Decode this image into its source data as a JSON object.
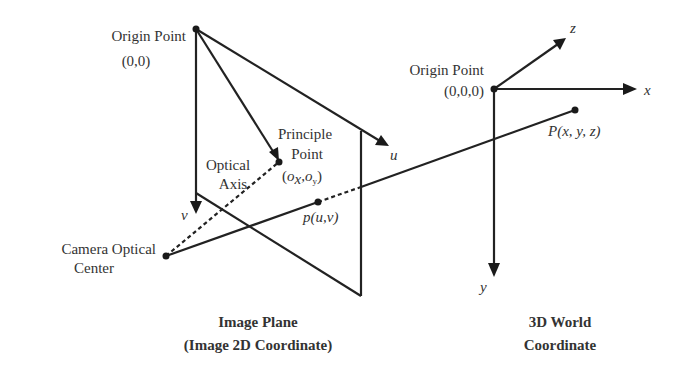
{
  "image_plane": {
    "origin_label": "Origin Point",
    "origin_coord": "(0,0)",
    "principle_label_1": "Principle",
    "principle_label_2": "Point",
    "principle_coord_open": "(",
    "principle_ox": "o",
    "principle_ox_sub": "x",
    "principle_comma": ",",
    "principle_oy": "o",
    "principle_oy_sub": "y",
    "principle_coord_close": ")",
    "optical_axis_1": "Optical",
    "optical_axis_2": "Axis",
    "u_axis": "u",
    "v_axis": "v",
    "projected_point": "p(u,v)",
    "title_1": "Image Plane",
    "title_2": "(Image 2D Coordinate)"
  },
  "camera": {
    "label_1": "Camera Optical",
    "label_2": "Center"
  },
  "world": {
    "origin_label": "Origin Point",
    "origin_coord": "(0,0,0)",
    "x_axis": "x",
    "y_axis": "y",
    "z_axis": "z",
    "point": "P(x, y, z)",
    "title_1": "3D World",
    "title_2": "Coordinate"
  },
  "colors": {
    "line": "#222222",
    "text": "#333333",
    "background": "#ffffff"
  }
}
